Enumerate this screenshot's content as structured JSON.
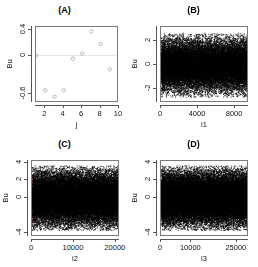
{
  "figure": {
    "layout": "2x2 grid of scatter plots",
    "background": "#ffffff",
    "point_color": "#9a9a9a",
    "dense_point_color": "#000000",
    "highlight_color": "#f08080",
    "axis_color": "#555555"
  },
  "panels": [
    {
      "id": "A",
      "title": "(A)",
      "xlabel": "j",
      "ylabel": "Bu",
      "xticks": [
        "2",
        "4",
        "6",
        "8",
        "10"
      ],
      "yticks": [
        "0.4",
        "0.0",
        "-0.6"
      ]
    },
    {
      "id": "B",
      "title": "(B)",
      "xlabel": "i1",
      "ylabel": "Bu",
      "xticks": [
        "0",
        "4000",
        "8000"
      ],
      "yticks": [
        "2",
        "0",
        "-2"
      ]
    },
    {
      "id": "C",
      "title": "(C)",
      "xlabel": "i2",
      "ylabel": "Bu",
      "xticks": [
        "0",
        "10000",
        "20000"
      ],
      "yticks": [
        "4",
        "2",
        "0",
        "-4"
      ]
    },
    {
      "id": "D",
      "title": "(D)",
      "xlabel": "i3",
      "ylabel": "Bu",
      "xticks": [
        "0",
        "10000",
        "25000"
      ],
      "yticks": [
        "4",
        "2",
        "0",
        "-4"
      ]
    }
  ],
  "chart_data": [
    {
      "type": "scatter",
      "title": "(A)",
      "xlabel": "j",
      "ylabel": "Bu",
      "xlim": [
        1,
        10
      ],
      "ylim": [
        -0.75,
        0.45
      ],
      "xticks": [
        2,
        4,
        6,
        8,
        10
      ],
      "yticks": [
        0.4,
        0.0,
        -0.6
      ],
      "grid": false,
      "x": [
        1,
        2,
        3,
        4,
        5,
        6,
        7,
        8,
        9,
        10
      ],
      "y": [
        0.0,
        -0.55,
        -0.65,
        -0.55,
        -0.05,
        0.03,
        0.38,
        0.18,
        -0.22,
        0.02
      ]
    },
    {
      "type": "scatter",
      "title": "(B)",
      "xlabel": "i1",
      "ylabel": "Bu",
      "xlim": [
        0,
        9500
      ],
      "ylim": [
        -3.2,
        3.2
      ],
      "xticks": [
        0,
        4000,
        8000
      ],
      "yticks": [
        2,
        0,
        -2
      ],
      "grid": false,
      "n_points": 9500,
      "description": "dense uniform band of residuals centered at 0, spread roughly -2.8 to 2.8, with a red highlighted cluster near x=0",
      "highlight_x_range": [
        0,
        300
      ]
    },
    {
      "type": "scatter",
      "title": "(C)",
      "xlabel": "i2",
      "ylabel": "Bu",
      "xlim": [
        0,
        21000
      ],
      "ylim": [
        -4.5,
        4.2
      ],
      "xticks": [
        0,
        10000,
        20000
      ],
      "yticks": [
        4,
        2,
        0,
        -4
      ],
      "grid": false,
      "n_points": 21000,
      "description": "dense uniform band of residuals centered at 0, spread roughly -3.8 to 3.5, with a red highlighted cluster near x=0",
      "highlight_x_range": [
        0,
        600
      ]
    },
    {
      "type": "scatter",
      "title": "(D)",
      "xlabel": "i3",
      "ylabel": "Bu",
      "xlim": [
        0,
        29000
      ],
      "ylim": [
        -4.5,
        4.2
      ],
      "xticks": [
        0,
        10000,
        25000
      ],
      "yticks": [
        4,
        2,
        0,
        -4
      ],
      "grid": false,
      "n_points": 29000,
      "description": "dense uniform band of residuals centered at 0, spread roughly -3.8 to 3.6, with a red highlighted cluster near x=0",
      "highlight_x_range": [
        0,
        700
      ]
    }
  ]
}
